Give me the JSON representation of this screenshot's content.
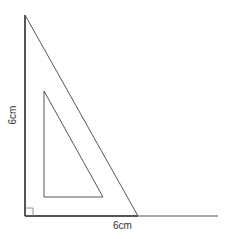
{
  "diagram": {
    "labels": {
      "vertical_side": "6cm",
      "horizontal_side": "6cm"
    },
    "colors": {
      "stroke": "#555555",
      "text": "#333333",
      "background": "#ffffff"
    },
    "shapes": {
      "outer_triangle": {
        "points": "25,15 25,216 138,216"
      },
      "inner_triangle": {
        "points": "44,91 44,197 103,197"
      },
      "baseline": {
        "x1": 25,
        "y1": 216,
        "x2": 218,
        "y2": 216
      },
      "right_angle_marker": {
        "x": 25,
        "y": 208,
        "size": 8
      }
    }
  }
}
